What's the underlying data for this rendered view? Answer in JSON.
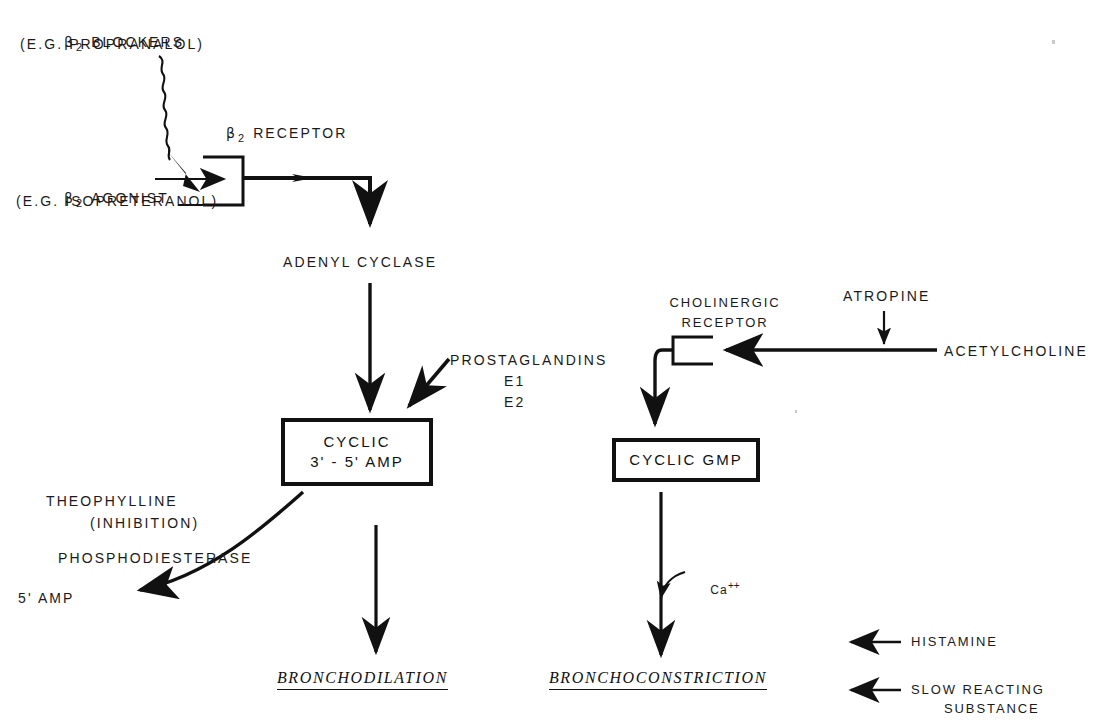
{
  "diagram": {
    "colors": {
      "ink": "#111111",
      "background": "#ffffff"
    },
    "left_pathway": {
      "blockers_line1_prefix": "β",
      "blockers_line1_sub": "2",
      "blockers_line1_rest": " BLOCKERS",
      "blockers_line2": "(E.G. PROPRANALOL)",
      "receptor_prefix": "β",
      "receptor_sub": "2",
      "receptor_rest": " RECEPTOR",
      "agonist_prefix": "β",
      "agonist_sub": "2",
      "agonist_rest": " AGONIST",
      "agonist_line2": "(E.G. ISOPRETERANOL)",
      "adenyl_cyclase": "ADENYL CYCLASE",
      "prostaglandins": "PROSTAGLANDINS",
      "prostaglandins_e1": "E1",
      "prostaglandins_e2": "E2",
      "camp_line1": "CYCLIC",
      "camp_line2": "3' - 5' AMP",
      "theophylline": "THEOPHYLLINE",
      "theophylline_note": "(INHIBITION)",
      "phosphodiesterase": "PHOSPHODIESTERASE",
      "amp5": "5' AMP",
      "outcome": "BRONCHODILATION"
    },
    "right_pathway": {
      "cholinergic_receptor_line1": "CHOLINERGIC",
      "cholinergic_receptor_line2": "RECEPTOR",
      "atropine": "ATROPINE",
      "acetylcholine": "ACETYLCHOLINE",
      "cgmp": "CYCLIC GMP",
      "calcium_symbol": "Ca",
      "calcium_charge": "++",
      "outcome": "BRONCHOCONSTRICTION"
    },
    "legend": {
      "histamine": "HISTAMINE",
      "srs_line1": "SLOW REACTING",
      "srs_line2": "SUBSTANCE"
    }
  }
}
